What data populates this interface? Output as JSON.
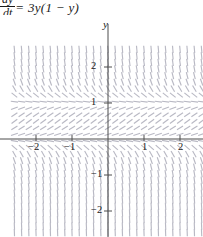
{
  "equation": {
    "numerator": "dy",
    "denominator": "dt",
    "right_side": "= 3y(1 − y)"
  },
  "axes": {
    "y_axis_label": "y",
    "x_tick_labels": [
      "−2",
      "−1",
      "1",
      "2"
    ],
    "y_tick_labels": [
      "2",
      "1",
      "−1",
      "−2"
    ]
  },
  "chart_data": {
    "type": "scatter",
    "title": "",
    "subtitle": "",
    "xlabel": "",
    "ylabel": "y",
    "xlim": [
      -2.15,
      2.15
    ],
    "ylim": [
      -2.35,
      2.35
    ],
    "xticks": [
      -2,
      -1,
      1,
      2
    ],
    "yticks": [
      2,
      1,
      -1,
      -2
    ],
    "grid": false,
    "legend": null,
    "annotations": [
      "dy/dt = 3y(1 − y)"
    ],
    "plot_kind": "slope-field",
    "equation": "dy/dt = 3*y*(1 - y)",
    "equilibria": [
      0,
      1
    ],
    "x_samples": [
      -2.0,
      -1.8,
      -1.6,
      -1.4,
      -1.2,
      -1.0,
      -0.8,
      -0.6,
      -0.4,
      -0.2,
      0.0,
      0.2,
      0.4,
      0.6,
      0.8,
      1.0,
      1.2,
      1.4,
      1.6,
      1.8,
      2.0
    ],
    "y_samples": [
      -2.0,
      -1.8,
      -1.6,
      -1.4,
      -1.2,
      -1.0,
      -0.8,
      -0.6,
      -0.4,
      -0.2,
      0.0,
      0.2,
      0.4,
      0.6,
      0.8,
      1.0,
      1.2,
      1.4,
      1.6,
      1.8,
      2.0
    ],
    "slope_by_y": [
      {
        "y": -2.0,
        "slope": -18.0
      },
      {
        "y": -1.8,
        "slope": -15.12
      },
      {
        "y": -1.6,
        "slope": -12.48
      },
      {
        "y": -1.4,
        "slope": -10.08
      },
      {
        "y": -1.2,
        "slope": -7.92
      },
      {
        "y": -1.0,
        "slope": -6.0
      },
      {
        "y": -0.8,
        "slope": -4.32
      },
      {
        "y": -0.6,
        "slope": -2.88
      },
      {
        "y": -0.4,
        "slope": -1.68
      },
      {
        "y": -0.2,
        "slope": -0.72
      },
      {
        "y": 0.0,
        "slope": 0.0
      },
      {
        "y": 0.2,
        "slope": 0.48
      },
      {
        "y": 0.4,
        "slope": 0.72
      },
      {
        "y": 0.6,
        "slope": 0.72
      },
      {
        "y": 0.8,
        "slope": 0.48
      },
      {
        "y": 1.0,
        "slope": 0.0
      },
      {
        "y": 1.2,
        "slope": -0.72
      },
      {
        "y": 1.4,
        "slope": -1.68
      },
      {
        "y": 1.6,
        "slope": -2.88
      },
      {
        "y": 1.8,
        "slope": -4.32
      },
      {
        "y": 2.0,
        "slope": -6.0
      }
    ]
  },
  "colors": {
    "axis": "#4d4d4d",
    "field": "#b9b9c4",
    "text": "#1a1a1a",
    "background": "#ffffff"
  }
}
